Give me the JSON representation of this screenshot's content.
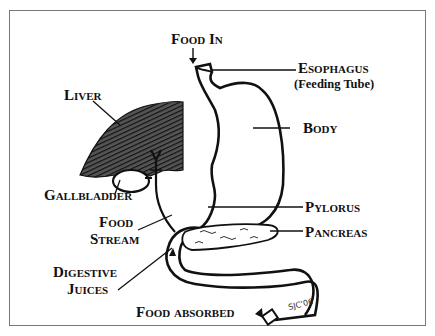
{
  "diagram": {
    "labels": {
      "food_in": "Food In",
      "esophagus": "Esophagus",
      "esophagus_sub": "(Feeding Tube)",
      "liver": "Liver",
      "body": "Body",
      "gallbladder": "Gallbladder",
      "pylorus": "Pylorus",
      "food": "Food",
      "stream": "Stream",
      "pancreas": "Pancreas",
      "digestive": "Digestive",
      "juices": "Juices",
      "food_absorbed": "Food absorbed"
    },
    "signature": "SJC'06",
    "colors": {
      "ink": "#111111",
      "border": "#777777",
      "background": "#ffffff"
    }
  }
}
